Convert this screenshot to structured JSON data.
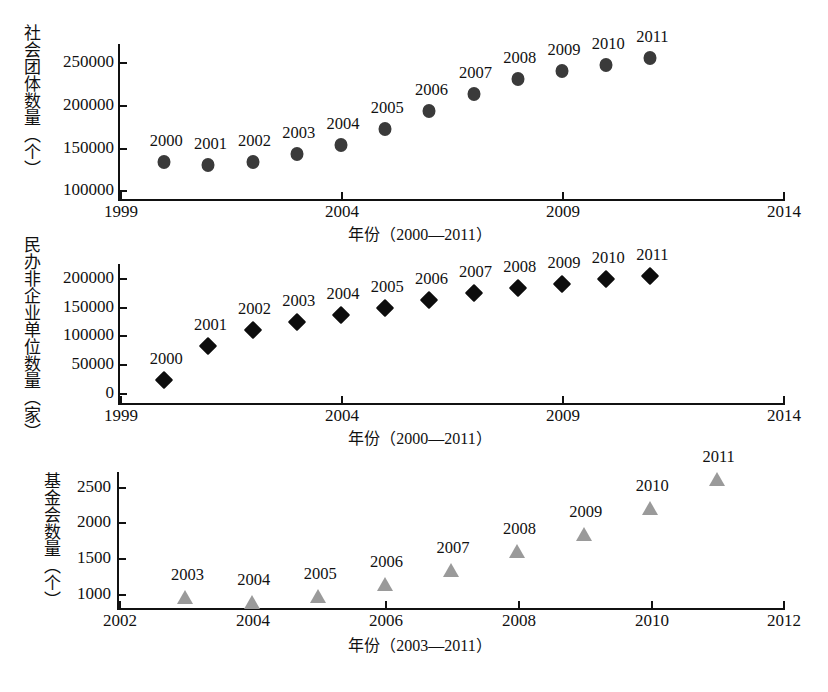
{
  "figure": {
    "background_color": "#ffffff",
    "text_color": "#111111"
  },
  "chart_data": [
    {
      "id": "social-organizations",
      "type": "scatter",
      "title": "",
      "ylabel": "社会团体数量（个）",
      "xlabel": "年份（2000—2011）",
      "marker": "circle",
      "marker_color": "#3a3a3a",
      "grid": false,
      "legend": "none",
      "xlim": [
        1999,
        2014
      ],
      "ylim": [
        90000,
        262000
      ],
      "xticks": [
        "1999",
        "2004",
        "2009",
        "2014"
      ],
      "xtick_values": [
        1999,
        2004,
        2009,
        2014
      ],
      "yticks": [
        "100000",
        "150000",
        "200000",
        "250000"
      ],
      "ytick_values": [
        100000,
        150000,
        200000,
        250000
      ],
      "x": [
        2000,
        2001,
        2002,
        2003,
        2004,
        2005,
        2006,
        2007,
        2008,
        2009,
        2010,
        2011
      ],
      "values": [
        133000,
        129000,
        133000,
        142000,
        153000,
        171000,
        192000,
        212000,
        230000,
        239000,
        246000,
        255000
      ],
      "point_labels": [
        "2000",
        "2001",
        "2002",
        "2003",
        "2004",
        "2005",
        "2006",
        "2007",
        "2008",
        "2009",
        "2010",
        "2011"
      ]
    },
    {
      "id": "private-non-enterprise-units",
      "type": "scatter",
      "title": "",
      "ylabel": "民办非企业单位数量（家）",
      "xlabel": "年份（2000—2011）",
      "marker": "diamond",
      "marker_color": "#0d0d0d",
      "grid": false,
      "legend": "none",
      "xlim": [
        1999,
        2014
      ],
      "ylim": [
        0,
        215000
      ],
      "xticks": [
        "1999",
        "2004",
        "2009",
        "2014"
      ],
      "xtick_values": [
        1999,
        2004,
        2009,
        2014
      ],
      "yticks": [
        "0",
        "50000",
        "100000",
        "150000",
        "200000"
      ],
      "ytick_values": [
        0,
        50000,
        100000,
        150000,
        200000
      ],
      "x": [
        2000,
        2001,
        2002,
        2003,
        2004,
        2005,
        2006,
        2007,
        2008,
        2009,
        2010,
        2011
      ],
      "values": [
        23000,
        82000,
        110000,
        124000,
        135000,
        148000,
        161000,
        174000,
        182000,
        190000,
        198000,
        204000
      ],
      "point_labels": [
        "2000",
        "2001",
        "2002",
        "2003",
        "2004",
        "2005",
        "2006",
        "2007",
        "2008",
        "2009",
        "2010",
        "2011"
      ]
    },
    {
      "id": "foundations",
      "type": "scatter",
      "title": "",
      "ylabel": "基金会数量（个）",
      "xlabel": "年份（2003—2011）",
      "marker": "triangle",
      "marker_color": "#9a9a9a",
      "grid": false,
      "legend": "none",
      "xlim": [
        2002,
        2012
      ],
      "ylim": [
        800,
        2720
      ],
      "xticks": [
        "2002",
        "2004",
        "2006",
        "2008",
        "2010",
        "2012"
      ],
      "xtick_values": [
        2002,
        2004,
        2006,
        2008,
        2010,
        2012
      ],
      "yticks": [
        "1000",
        "1500",
        "2000",
        "2500"
      ],
      "ytick_values": [
        1000,
        1500,
        2000,
        2500
      ],
      "x": [
        2003,
        2004,
        2005,
        2006,
        2007,
        2008,
        2009,
        2010,
        2011
      ],
      "values": [
        955,
        892,
        975,
        1144,
        1340,
        1597,
        1843,
        2200,
        2610
      ],
      "point_labels": [
        "2003",
        "2004",
        "2005",
        "2006",
        "2007",
        "2008",
        "2009",
        "2010",
        "2011"
      ]
    }
  ]
}
